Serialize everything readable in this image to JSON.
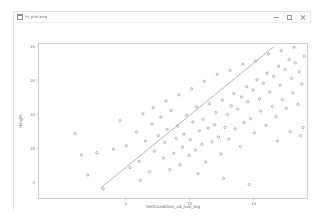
{
  "window": {
    "title": "fit_plot.png",
    "icon": "image-file-icon",
    "controls": [
      {
        "name": "minimize-button",
        "label": "—",
        "icon": "minimize-icon"
      },
      {
        "name": "maximize-button",
        "label": "□",
        "icon": "maximize-icon"
      },
      {
        "name": "close-button",
        "label": "✕",
        "icon": "close-icon"
      }
    ]
  },
  "chart_data": {
    "type": "scatter",
    "title": "",
    "xlabel": "testCondition_vd_non_log",
    "ylabel": "Height",
    "xlim": [
      -1.8,
      19.2
    ],
    "ylim": [
      2.6,
      25.4
    ],
    "xticks": [
      5,
      10,
      15
    ],
    "xtick_labels": [
      "5",
      "10",
      "15"
    ],
    "yticks": [
      5,
      10,
      15,
      20,
      25
    ],
    "ytick_labels": [
      "5",
      "10",
      "15",
      "20",
      "25"
    ],
    "grid": false,
    "legend": null,
    "marker_style": "open-circle",
    "marker_color": "#7b7f93",
    "fit_line": {
      "label": "linear fit",
      "color": "#8a8fa3",
      "x": [
        3.05,
        16.55
      ],
      "y": [
        4.15,
        24.9
      ]
    },
    "points": [
      {
        "x": 1.05,
        "y": 12.15
      },
      {
        "x": 1.55,
        "y": 9.05
      },
      {
        "x": 2.05,
        "y": 6.05
      },
      {
        "x": 2.75,
        "y": 9.35
      },
      {
        "x": 3.25,
        "y": 4.05
      },
      {
        "x": 4.05,
        "y": 9.85
      },
      {
        "x": 4.55,
        "y": 14.05
      },
      {
        "x": 5.05,
        "y": 10.35
      },
      {
        "x": 5.35,
        "y": 7.15
      },
      {
        "x": 5.85,
        "y": 12.35
      },
      {
        "x": 6.05,
        "y": 8.05
      },
      {
        "x": 6.35,
        "y": 15.05
      },
      {
        "x": 6.55,
        "y": 11.05
      },
      {
        "x": 6.85,
        "y": 6.55
      },
      {
        "x": 7.05,
        "y": 13.55
      },
      {
        "x": 7.25,
        "y": 9.55
      },
      {
        "x": 7.55,
        "y": 11.85
      },
      {
        "x": 7.75,
        "y": 14.55
      },
      {
        "x": 7.95,
        "y": 8.55
      },
      {
        "x": 8.05,
        "y": 10.85
      },
      {
        "x": 8.25,
        "y": 12.75
      },
      {
        "x": 8.45,
        "y": 6.85
      },
      {
        "x": 8.55,
        "y": 15.55
      },
      {
        "x": 8.75,
        "y": 9.25
      },
      {
        "x": 8.95,
        "y": 11.45
      },
      {
        "x": 9.05,
        "y": 13.25
      },
      {
        "x": 9.25,
        "y": 7.55
      },
      {
        "x": 9.45,
        "y": 10.15
      },
      {
        "x": 9.55,
        "y": 12.05
      },
      {
        "x": 9.75,
        "y": 14.85
      },
      {
        "x": 9.95,
        "y": 8.95
      },
      {
        "x": 10.05,
        "y": 11.25
      },
      {
        "x": 10.25,
        "y": 13.85
      },
      {
        "x": 10.45,
        "y": 9.75
      },
      {
        "x": 10.55,
        "y": 16.05
      },
      {
        "x": 10.75,
        "y": 12.55
      },
      {
        "x": 10.95,
        "y": 10.55
      },
      {
        "x": 11.05,
        "y": 14.25
      },
      {
        "x": 11.25,
        "y": 7.95
      },
      {
        "x": 11.45,
        "y": 12.95
      },
      {
        "x": 11.55,
        "y": 16.55
      },
      {
        "x": 11.75,
        "y": 10.95
      },
      {
        "x": 11.95,
        "y": 13.45
      },
      {
        "x": 12.05,
        "y": 15.25
      },
      {
        "x": 12.25,
        "y": 11.65
      },
      {
        "x": 12.45,
        "y": 9.15
      },
      {
        "x": 12.55,
        "y": 17.05
      },
      {
        "x": 12.75,
        "y": 13.05
      },
      {
        "x": 12.95,
        "y": 14.95
      },
      {
        "x": 13.05,
        "y": 11.35
      },
      {
        "x": 13.25,
        "y": 16.25
      },
      {
        "x": 13.45,
        "y": 18.05
      },
      {
        "x": 13.55,
        "y": 12.85
      },
      {
        "x": 13.75,
        "y": 15.75
      },
      {
        "x": 13.95,
        "y": 10.25
      },
      {
        "x": 14.05,
        "y": 17.55
      },
      {
        "x": 14.25,
        "y": 13.75
      },
      {
        "x": 14.45,
        "y": 19.05
      },
      {
        "x": 14.55,
        "y": 16.85
      },
      {
        "x": 14.75,
        "y": 14.35
      },
      {
        "x": 14.95,
        "y": 18.55
      },
      {
        "x": 15.05,
        "y": 12.25
      },
      {
        "x": 15.25,
        "y": 20.05
      },
      {
        "x": 15.45,
        "y": 17.25
      },
      {
        "x": 15.55,
        "y": 15.45
      },
      {
        "x": 15.75,
        "y": 19.55
      },
      {
        "x": 15.95,
        "y": 13.35
      },
      {
        "x": 16.05,
        "y": 21.05
      },
      {
        "x": 16.25,
        "y": 18.25
      },
      {
        "x": 16.45,
        "y": 16.15
      },
      {
        "x": 16.55,
        "y": 20.55
      },
      {
        "x": 16.75,
        "y": 14.65
      },
      {
        "x": 16.95,
        "y": 22.05
      },
      {
        "x": 17.05,
        "y": 19.25
      },
      {
        "x": 17.25,
        "y": 17.15
      },
      {
        "x": 17.45,
        "y": 21.55
      },
      {
        "x": 17.55,
        "y": 15.85
      },
      {
        "x": 17.75,
        "y": 23.05
      },
      {
        "x": 17.95,
        "y": 20.25
      },
      {
        "x": 18.05,
        "y": 18.15
      },
      {
        "x": 18.25,
        "y": 22.55
      },
      {
        "x": 18.45,
        "y": 16.45
      },
      {
        "x": 18.55,
        "y": 21.25
      },
      {
        "x": 18.75,
        "y": 19.45
      },
      {
        "x": 18.95,
        "y": 23.55
      },
      {
        "x": 12.15,
        "y": 20.85
      },
      {
        "x": 13.15,
        "y": 21.45
      },
      {
        "x": 14.15,
        "y": 22.35
      },
      {
        "x": 11.15,
        "y": 19.85
      },
      {
        "x": 10.15,
        "y": 18.75
      },
      {
        "x": 9.15,
        "y": 17.85
      },
      {
        "x": 8.15,
        "y": 16.95
      },
      {
        "x": 7.15,
        "y": 15.95
      },
      {
        "x": 16.15,
        "y": 23.85
      },
      {
        "x": 17.15,
        "y": 24.35
      },
      {
        "x": 15.15,
        "y": 22.85
      },
      {
        "x": 18.15,
        "y": 24.85
      },
      {
        "x": 6.15,
        "y": 5.25
      },
      {
        "x": 12.65,
        "y": 5.55
      },
      {
        "x": 14.65,
        "y": 4.65
      },
      {
        "x": 10.65,
        "y": 6.25
      },
      {
        "x": 18.85,
        "y": 13.05
      },
      {
        "x": 18.65,
        "y": 11.85
      },
      {
        "x": 17.85,
        "y": 12.45
      },
      {
        "x": 16.85,
        "y": 11.05
      }
    ]
  }
}
